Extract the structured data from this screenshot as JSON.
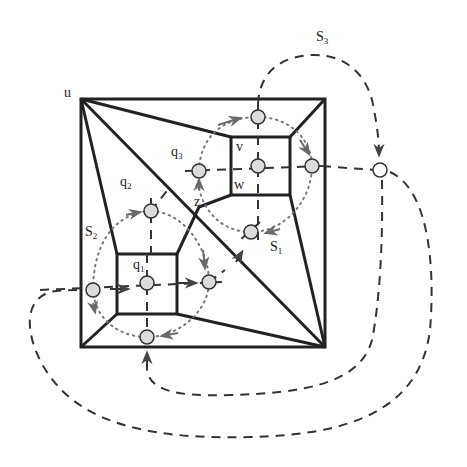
{
  "diagram": {
    "type": "planar graph with spanning cycles",
    "colors": {
      "edge": "#222222",
      "node_fill": "#dcdcdc",
      "node_stroke": "#333333",
      "arrow": "#555555",
      "dotted": "#777777"
    },
    "labels": {
      "u": "u",
      "v": "v",
      "w": "w",
      "z": "z",
      "q1": "q",
      "q1_sub": "1",
      "q2": "q",
      "q2_sub": "2",
      "q3": "q",
      "q3_sub": "3",
      "S1": "S",
      "S1_sub": "1",
      "S2": "S",
      "S2_sub": "2",
      "S3": "S",
      "S3_sub": "3"
    },
    "outer_square": {
      "x1": 81,
      "y1": 99,
      "x2": 325,
      "y2": 347
    },
    "inner_squares": [
      {
        "name": "upper-right",
        "x1": 231,
        "y1": 137,
        "x2": 290,
        "y2": 195
      },
      {
        "name": "lower-left",
        "x1": 117,
        "y1": 254,
        "x2": 177,
        "y2": 314
      }
    ],
    "nodes": [
      {
        "id": "q3-center",
        "x": 258,
        "y": 166
      },
      {
        "id": "top",
        "x": 258,
        "y": 117
      },
      {
        "id": "right-inner",
        "x": 312,
        "y": 166
      },
      {
        "id": "q3",
        "x": 199,
        "y": 171
      },
      {
        "id": "bottom-mid",
        "x": 251,
        "y": 232
      },
      {
        "id": "outer-right",
        "x": 380,
        "y": 170
      },
      {
        "id": "q2",
        "x": 151,
        "y": 211
      },
      {
        "id": "q1-center",
        "x": 147,
        "y": 283
      },
      {
        "id": "left",
        "x": 93,
        "y": 290
      },
      {
        "id": "mid-right",
        "x": 209,
        "y": 282
      },
      {
        "id": "bottom",
        "x": 147,
        "y": 337
      }
    ]
  }
}
